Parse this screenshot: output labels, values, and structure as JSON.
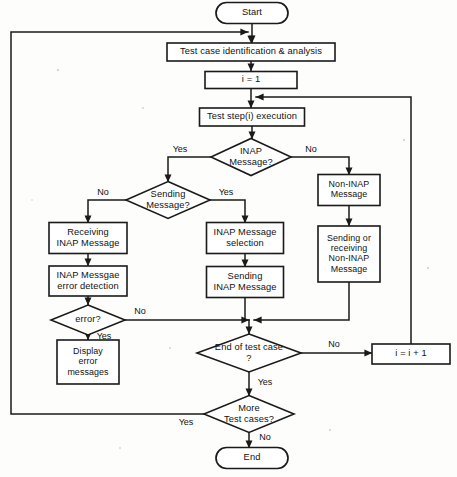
{
  "diagram": {
    "type": "flowchart",
    "orientation": "top-to-bottom",
    "nodes": [
      {
        "id": "start",
        "shape": "terminator",
        "label": "Start",
        "cx": 252,
        "cy": 13,
        "w": 72,
        "h": 21
      },
      {
        "id": "identify",
        "shape": "process",
        "label": "Test case identification & analysis",
        "cx": 251,
        "cy": 52,
        "w": 168,
        "h": 18
      },
      {
        "id": "init",
        "shape": "process",
        "label": "i = 1",
        "cx": 251,
        "cy": 80,
        "w": 92,
        "h": 17
      },
      {
        "id": "teststep",
        "shape": "process",
        "label": "Test step(i) execution",
        "cx": 252,
        "cy": 117,
        "w": 105,
        "h": 18
      },
      {
        "id": "inapq",
        "shape": "decision",
        "label": "INAP Message?",
        "cx": 251,
        "cy": 157,
        "w": 80,
        "h": 37
      },
      {
        "id": "sendq",
        "shape": "decision",
        "label": "Sending Message?",
        "cx": 168,
        "cy": 200,
        "w": 84,
        "h": 37
      },
      {
        "id": "noninap",
        "shape": "process",
        "label": "Non-INAP Message",
        "cx": 349,
        "cy": 190,
        "w": 62,
        "h": 31
      },
      {
        "id": "recvinap",
        "shape": "process",
        "label": "Receiving INAP Message",
        "cx": 88,
        "cy": 238,
        "w": 78,
        "h": 31
      },
      {
        "id": "errdetect",
        "shape": "process",
        "label": "INAP Messgae error detection",
        "cx": 88,
        "cy": 281,
        "w": 78,
        "h": 30
      },
      {
        "id": "msgselect",
        "shape": "process",
        "label": "INAP Message selection",
        "cx": 245,
        "cy": 238,
        "w": 77,
        "h": 31
      },
      {
        "id": "sendinap",
        "shape": "process",
        "label": "Sending INAP Message",
        "cx": 245,
        "cy": 282,
        "w": 77,
        "h": 31
      },
      {
        "id": "sendrecv",
        "shape": "process",
        "label": "Sending or receiving Non-INAP Message",
        "cx": 349,
        "cy": 254,
        "w": 62,
        "h": 56
      },
      {
        "id": "errorq",
        "shape": "decision",
        "label": "error?",
        "cx": 88,
        "cy": 320,
        "w": 74,
        "h": 30
      },
      {
        "id": "display",
        "shape": "process",
        "label": "Display error messages",
        "cx": 88,
        "cy": 362,
        "w": 62,
        "h": 44
      },
      {
        "id": "endcaseq",
        "shape": "decision",
        "label": "End of test case ?",
        "cx": 249,
        "cy": 353,
        "w": 104,
        "h": 38
      },
      {
        "id": "increment",
        "shape": "process",
        "label": "i = i + 1",
        "cx": 411,
        "cy": 354,
        "w": 78,
        "h": 20
      },
      {
        "id": "morecasesq",
        "shape": "decision",
        "label": "More Test cases?",
        "cx": 249,
        "cy": 414,
        "w": 90,
        "h": 37
      },
      {
        "id": "end",
        "shape": "terminator",
        "label": "End",
        "cx": 252,
        "cy": 458,
        "w": 72,
        "h": 21
      }
    ],
    "node_labels": {
      "start": [
        "Start"
      ],
      "identify": [
        "Test case identification & analysis"
      ],
      "init": [
        "i = 1"
      ],
      "teststep": [
        "Test step(i) execution"
      ],
      "inapq": [
        "INAP",
        "Message?"
      ],
      "sendq": [
        "Sending",
        "Message?"
      ],
      "noninap": [
        "Non-INAP",
        "Message"
      ],
      "recvinap": [
        "Receiving",
        "INAP Message"
      ],
      "errdetect": [
        "INAP Messgae",
        "error detection"
      ],
      "msgselect": [
        "INAP Message",
        "selection"
      ],
      "sendinap": [
        "Sending",
        "INAP Message"
      ],
      "sendrecv": [
        "Sending or",
        "receiving",
        "Non-INAP",
        "Message"
      ],
      "errorq": [
        "error?"
      ],
      "display": [
        "Display",
        "error",
        "messages"
      ],
      "endcaseq": [
        "End of test case",
        "?"
      ],
      "increment": [
        "i = i + 1"
      ],
      "morecasesq": [
        "More",
        "Test cases?"
      ],
      "end": [
        "End"
      ]
    },
    "edges": [
      {
        "id": "e-start-identify",
        "from": "start",
        "to": "identify",
        "points": "252,23 252,43",
        "arrow": "down"
      },
      {
        "id": "e-identify-init",
        "from": "identify",
        "to": "init",
        "points": "251,61 251,71",
        "arrow": "down"
      },
      {
        "id": "e-init-teststep",
        "from": "init",
        "to": "teststep",
        "points": "251,89 251,108",
        "arrow": "down"
      },
      {
        "id": "e-teststep-inapq",
        "from": "teststep",
        "to": "inapq",
        "points": "252,126 252,139",
        "arrow": "down"
      },
      {
        "id": "e-inapq-sendq",
        "from": "inapq",
        "to": "sendq",
        "points": "211,157 168,157 168,182",
        "arrow": "down",
        "label": "Yes",
        "label_x": 180,
        "label_y": 150
      },
      {
        "id": "e-inapq-noninap",
        "from": "inapq",
        "to": "noninap",
        "points": "291,157 349,157 349,175",
        "arrow": "down",
        "label": "No",
        "label_x": 311,
        "label_y": 150
      },
      {
        "id": "e-sendq-recvinap",
        "from": "sendq",
        "to": "recvinap",
        "points": "126,200 88,200 88,223",
        "arrow": "down",
        "label": "No",
        "label_x": 103,
        "label_y": 193
      },
      {
        "id": "e-sendq-msgselect",
        "from": "sendq",
        "to": "msgselect",
        "points": "210,200 245,200 245,223",
        "arrow": "down",
        "label": "Yes",
        "label_x": 226,
        "label_y": 193
      },
      {
        "id": "e-recvinap-errdetect",
        "from": "recvinap",
        "to": "errdetect",
        "points": "88,254 88,266",
        "arrow": "down"
      },
      {
        "id": "e-errdetect-errorq",
        "from": "errdetect",
        "to": "errorq",
        "points": "88,296 88,305",
        "arrow": "down"
      },
      {
        "id": "e-msgselect-sendinap",
        "from": "msgselect",
        "to": "sendinap",
        "points": "245,254 245,267",
        "arrow": "down"
      },
      {
        "id": "e-noninap-sendrecv",
        "from": "noninap",
        "to": "sendrecv",
        "points": "349,206 349,226",
        "arrow": "down"
      },
      {
        "id": "e-errorq-display",
        "from": "errorq",
        "to": "display",
        "points": "88,335 88,340",
        "arrow": "down",
        "label": "Yes",
        "label_x": 104,
        "label_y": 337
      },
      {
        "id": "e-errorq-join",
        "from": "errorq",
        "to": "endcaseq",
        "points": "125,320 249,320",
        "arrow": "right",
        "label": "No",
        "label_x": 140,
        "label_y": 312
      },
      {
        "id": "e-sendinap-join",
        "from": "sendinap",
        "to": "endcaseq",
        "points": "245,298 245,320",
        "arrow": "none"
      },
      {
        "id": "e-sendrecv-join",
        "from": "sendrecv",
        "to": "endcaseq",
        "points": "349,282 349,320 254,320",
        "arrow": "left"
      },
      {
        "id": "e-join-endcaseq",
        "from": "join",
        "to": "endcaseq",
        "points": "249,320 249,334",
        "arrow": "down"
      },
      {
        "id": "e-endcaseq-increment",
        "from": "endcaseq",
        "to": "increment",
        "points": "301,353 372,353",
        "arrow": "right",
        "label": "No",
        "label_x": 334,
        "label_y": 345
      },
      {
        "id": "e-increment-teststep",
        "from": "increment",
        "to": "teststep",
        "points": "411,344 411,97 256,97",
        "arrow": "left"
      },
      {
        "id": "e-endcaseq-morecases",
        "from": "endcaseq",
        "to": "morecasesq",
        "points": "249,372 249,396",
        "arrow": "down",
        "label": "Yes",
        "label_x": 265,
        "label_y": 383
      },
      {
        "id": "e-morecases-identify",
        "from": "morecasesq",
        "to": "identify",
        "points": "204,414 11,414 11,32 248,32",
        "arrow": "down",
        "label": "Yes",
        "label_x": 186,
        "label_y": 423
      },
      {
        "id": "e-morecases-end",
        "from": "morecasesq",
        "to": "end",
        "points": "249,432 249,448",
        "arrow": "down",
        "label": "No",
        "label_x": 265,
        "label_y": 438
      }
    ],
    "loop_arrow_into_identify": {
      "x": 251,
      "y": 43
    },
    "colors": {
      "stroke": "#1a1a1a",
      "fill": "#ffffff",
      "background": "#fdfdfb",
      "text": "#111111"
    }
  }
}
